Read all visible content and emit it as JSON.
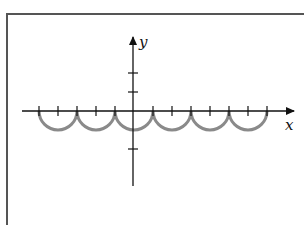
{
  "diagram": {
    "type": "function-graph",
    "axes": {
      "x_label": "x",
      "y_label": "y",
      "origin_px": [
        133,
        111
      ],
      "x_axis_px": [
        22,
        296
      ],
      "y_axis_px": [
        185,
        36
      ],
      "x_tick_spacing_px": 19,
      "y_ticks_px": [
        73,
        92,
        149
      ]
    },
    "curve": {
      "description": "Repeating lower semicircles touching the x-axis",
      "color": "#8a8a8a",
      "arc_count": 6,
      "radius_px": 19,
      "endpoints_px": [
        39,
        77,
        115,
        153,
        191,
        229,
        267
      ]
    },
    "colors": {
      "axis": "#111111",
      "frame": "#555555",
      "curve": "#8a8a8a"
    }
  }
}
